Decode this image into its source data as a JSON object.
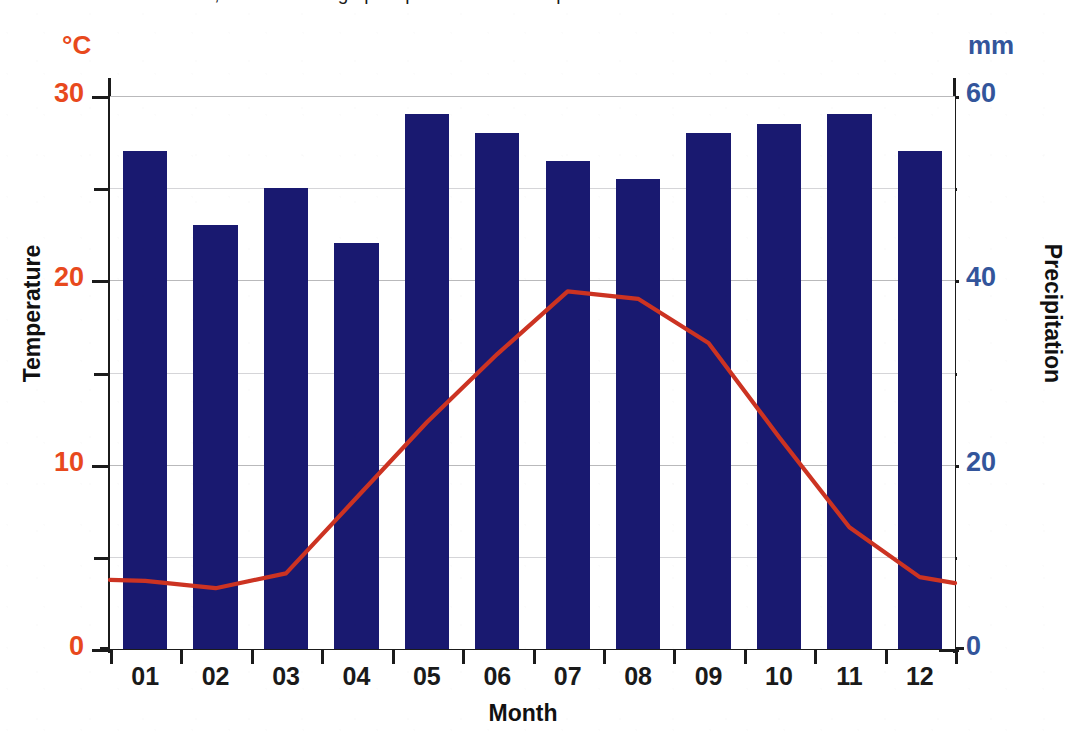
{
  "page": {
    "title_clipped": "climatic conditions, with an average precipitation of 50 mm per month",
    "caption_visible": false
  },
  "chart": {
    "left_axis_unit": "°C",
    "right_axis_unit": "mm",
    "left_axis_title": "Temperature",
    "right_axis_title": "Precipitation",
    "x_axis_title": "Month",
    "left_tick_labels": [
      "30",
      "20",
      "10",
      "0"
    ],
    "right_tick_labels": [
      "60",
      "40",
      "20",
      "0"
    ],
    "month_labels": [
      "01",
      "02",
      "03",
      "04",
      "05",
      "06",
      "07",
      "08",
      "09",
      "10",
      "11",
      "12"
    ],
    "colors": {
      "bar": "#191970",
      "line": "#cc3322",
      "left_axis_text": "#e8491d",
      "right_axis_text": "#33559b",
      "grid": "#b9b9bb",
      "axis": "#1b1b1b",
      "background": "#ffffff"
    }
  },
  "chart_data": {
    "type": "bar",
    "title": "",
    "subtitle": "",
    "xlabel": "Month",
    "ylabel": "Temperature",
    "y2label": "Precipitation",
    "categories": [
      "01",
      "02",
      "03",
      "04",
      "05",
      "06",
      "07",
      "08",
      "09",
      "10",
      "11",
      "12"
    ],
    "grid": true,
    "legend": "none",
    "axes": [
      {
        "id": "left",
        "label": "Temperature",
        "unit": "°C",
        "lim": [
          0,
          30
        ],
        "major_ticks": [
          0,
          10,
          20,
          30
        ],
        "minor_ticks": [
          5,
          15,
          25
        ],
        "color": "#e8491d"
      },
      {
        "id": "right",
        "label": "Precipitation",
        "unit": "mm",
        "lim": [
          0,
          60
        ],
        "major_ticks": [
          0,
          20,
          40,
          60
        ],
        "minor_ticks": [
          10,
          30,
          50
        ],
        "color": "#33559b"
      }
    ],
    "series": [
      {
        "name": "Precipitation",
        "type": "bar",
        "axis": "right",
        "unit": "mm",
        "color": "#191970",
        "values": [
          54,
          46,
          50,
          44,
          58,
          56,
          53,
          51,
          56,
          57,
          58,
          54
        ]
      },
      {
        "name": "Temperature",
        "type": "line",
        "axis": "left",
        "unit": "°C",
        "color": "#cc3322",
        "values": [
          3.7,
          3.3,
          4.1,
          8.2,
          12.3,
          16.0,
          19.4,
          19.0,
          16.6,
          11.5,
          6.6,
          3.9
        ]
      }
    ]
  }
}
